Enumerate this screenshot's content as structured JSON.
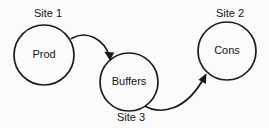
{
  "diagram": {
    "type": "node-edge-diagram",
    "background_color": "#fbfbfc",
    "stroke_color": "#1a1a1a",
    "nodes": [
      {
        "id": "prod",
        "label": "Prod",
        "site_label": "Site 1",
        "site_label_position": "above",
        "cx": 44,
        "cy": 55,
        "r": 30,
        "label_x": 44,
        "label_y": 55,
        "site_x": 48,
        "site_y": 14
      },
      {
        "id": "buffers",
        "label": "Buffers",
        "site_label": "Site 3",
        "site_label_position": "below",
        "cx": 129,
        "cy": 82,
        "r": 29,
        "label_x": 129,
        "label_y": 82,
        "site_x": 131,
        "site_y": 118
      },
      {
        "id": "cons",
        "label": "Cons",
        "site_label": "Site 2",
        "site_label_position": "above",
        "cx": 227,
        "cy": 51,
        "r": 29,
        "label_x": 227,
        "label_y": 51,
        "site_x": 230,
        "site_y": 14
      }
    ],
    "edges": [
      {
        "id": "prod-to-buffers",
        "from": "prod",
        "to": "buffers",
        "directed": true,
        "path": "M 71.5 38.5 C 86 30 104 38 110 57.5",
        "arrow_points": "110,60.5 104.2,51.8 114.2,52.4"
      },
      {
        "id": "buffers-to-cons",
        "from": "buffers",
        "to": "cons",
        "directed": true,
        "path": "M 144 105.5 C 160 115 186 112 205 76",
        "arrow_points": "206.5,73.2 198.5,79.8 205.8,84.0"
      }
    ]
  }
}
